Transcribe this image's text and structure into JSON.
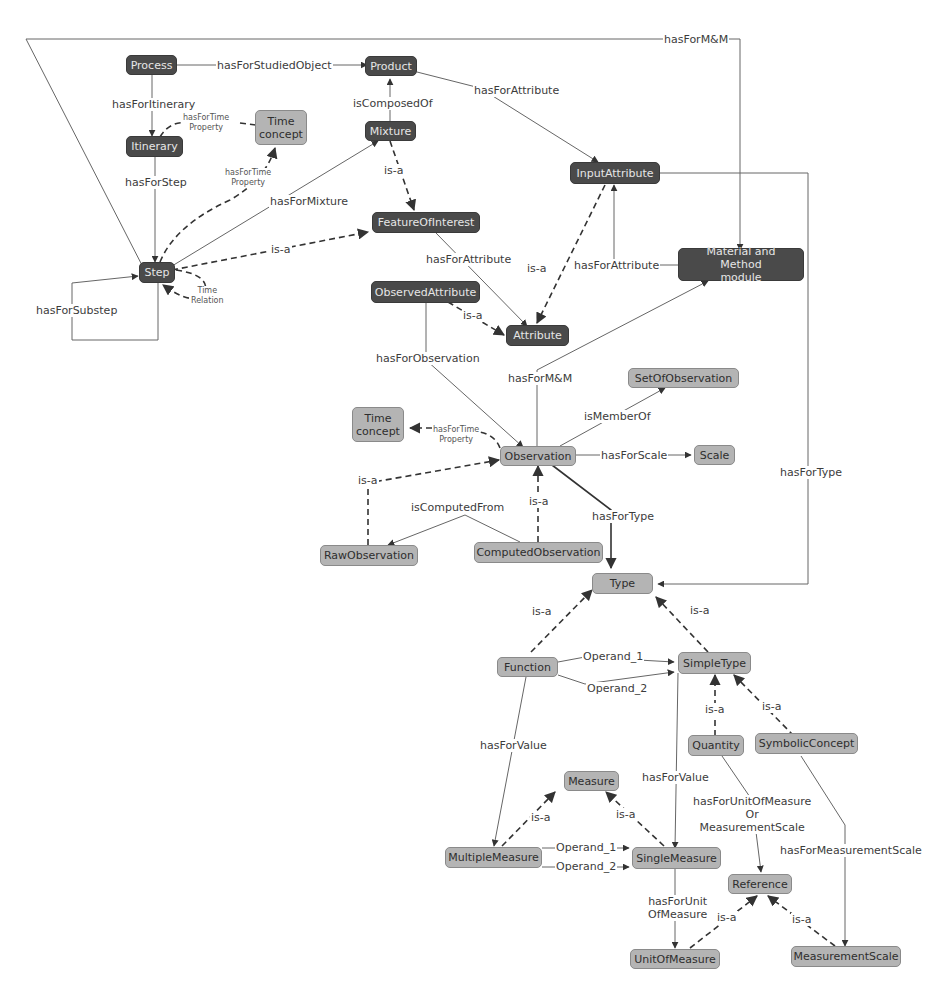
{
  "diagram": {
    "type": "ontology-concept-map",
    "colors": {
      "dark_node_fill": "#4a4a4a",
      "dark_node_text": "#e6e6e6",
      "light_node_fill": "#b4b4b4",
      "light_node_text": "#2e2e2e",
      "edge": "#555555",
      "background": "#ffffff"
    },
    "nodes": {
      "process": "Process",
      "product": "Product",
      "itinerary": "Itinerary",
      "time_concept_top": "Time\nconcept",
      "mixture": "Mixture",
      "feature_of_interest": "FeatureOfInterest",
      "step": "Step",
      "input_attribute": "InputAttribute",
      "material_method": "Material and Method\nmodule",
      "observed_attribute": "ObservedAttribute",
      "attribute": "Attribute",
      "set_of_observation": "SetOfObservation",
      "time_concept_mid": "Time\nconcept",
      "observation": "Observation",
      "scale": "Scale",
      "raw_observation": "RawObservation",
      "computed_observation": "ComputedObservation",
      "type": "Type",
      "function": "Function",
      "simple_type": "SimpleType",
      "quantity": "Quantity",
      "symbolic_concept": "SymbolicConcept",
      "measure": "Measure",
      "multiple_measure": "MultipleMeasure",
      "single_measure": "SingleMeasure",
      "reference": "Reference",
      "unit_of_measure": "UnitOfMeasure",
      "measurement_scale": "MeasurementScale"
    },
    "edges": {
      "has_for_mm_top": "hasForM&M",
      "has_for_studied_object": "hasForStudiedObject",
      "has_for_itinerary": "hasForItinerary",
      "has_for_time_property_1": "hasForTime\nProperty",
      "is_composed_of": "isComposedOf",
      "has_for_attribute_1": "hasForAttribute",
      "has_for_step": "hasForStep",
      "has_for_time_property_2": "hasForTime\nProperty",
      "has_for_mixture": "hasForMixture",
      "is_a_mixture": "is-a",
      "is_a_step": "is-a",
      "time_relation": "Time\nRelation",
      "has_for_substep": "hasForSubstep",
      "has_for_attribute_2": "hasForAttribute",
      "is_a_input_attr": "is-a",
      "has_for_attribute_3": "hasForAttribute",
      "is_a_observed_attr": "is-a",
      "has_for_observation": "hasForObservation",
      "has_for_mm_obs": "hasForM&M",
      "is_member_of": "isMemberOf",
      "has_for_time_property_3": "hasForTime\nProperty",
      "has_for_scale": "hasForScale",
      "is_a_raw": "is-a",
      "is_computed_from": "isComputedFrom",
      "is_a_computed": "is-a",
      "has_for_type_obs": "hasForType",
      "has_for_type_input": "hasForType",
      "is_a_function": "is-a",
      "is_a_simple_type": "is-a",
      "operand_1_fn": "Operand_1",
      "operand_2_fn": "Operand_2",
      "is_a_quantity": "is-a",
      "is_a_symbolic": "is-a",
      "has_for_value_fn": "hasForValue",
      "has_for_value_st": "hasForValue",
      "has_for_uom_or_ms": "hasForUnitOfMeasure\nOr\nMeasurementScale",
      "has_for_measurement_scale": "hasForMeasurementScale",
      "is_a_multiple": "is-a",
      "is_a_single": "is-a",
      "operand_1_mm": "Operand_1",
      "operand_2_mm": "Operand_2",
      "has_for_unit_of_measure": "hasForUnit\nOfMeasure",
      "is_a_uom": "is-a",
      "is_a_ms": "is-a"
    }
  }
}
